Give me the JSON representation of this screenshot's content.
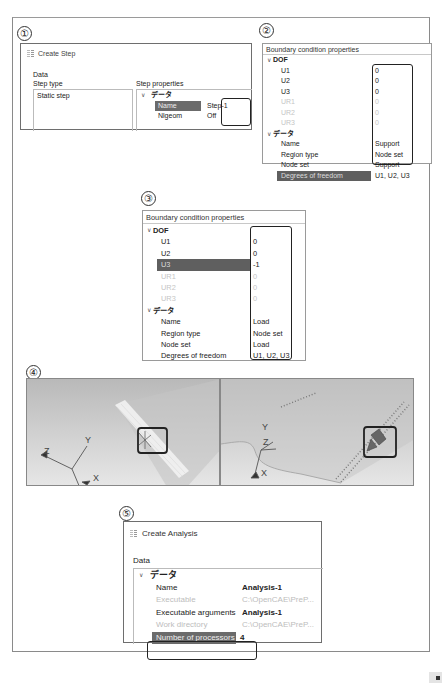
{
  "step_numbers": [
    "①",
    "②",
    "③",
    "④",
    "⑤"
  ],
  "panel1": {
    "dialog_title": "Create Step",
    "data_label": "Data",
    "step_type_label": "Step type",
    "step_properties_label": "Step properties",
    "step_types": [
      "Static step"
    ],
    "group_label": "データ",
    "properties": [
      {
        "key": "Name",
        "value": "Step-1",
        "selected": true
      },
      {
        "key": "Nlgeom",
        "value": "Off",
        "selected": false
      }
    ]
  },
  "panel2": {
    "header": "Boundary condition properties",
    "dof_group": "DOF",
    "dof": [
      {
        "key": "U1",
        "value": "0",
        "enabled": true
      },
      {
        "key": "U2",
        "value": "0",
        "enabled": true
      },
      {
        "key": "U3",
        "value": "0",
        "enabled": true
      },
      {
        "key": "UR1",
        "value": "0",
        "enabled": false
      },
      {
        "key": "UR2",
        "value": "0",
        "enabled": false
      },
      {
        "key": "UR3",
        "value": "0",
        "enabled": false
      }
    ],
    "data_group": "データ",
    "data": [
      {
        "key": "Name",
        "value": "Support"
      },
      {
        "key": "Region type",
        "value": "Node set"
      },
      {
        "key": "Node set",
        "value": "Support"
      },
      {
        "key": "Degrees of freedom",
        "value": "U1, U2, U3",
        "selected": true
      }
    ]
  },
  "panel3": {
    "header": "Boundary condition properties",
    "dof_group": "DOF",
    "dof": [
      {
        "key": "U1",
        "value": "0",
        "enabled": true
      },
      {
        "key": "U2",
        "value": "0",
        "enabled": true
      },
      {
        "key": "U3",
        "value": "-1",
        "enabled": true,
        "selected": true
      },
      {
        "key": "UR1",
        "value": "0",
        "enabled": false
      },
      {
        "key": "UR2",
        "value": "0",
        "enabled": false
      },
      {
        "key": "UR3",
        "value": "0",
        "enabled": false
      }
    ],
    "data_group": "データ",
    "data": [
      {
        "key": "Name",
        "value": "Load"
      },
      {
        "key": "Region type",
        "value": "Node set"
      },
      {
        "key": "Node set",
        "value": "Load"
      },
      {
        "key": "Degrees of freedom",
        "value": "U1, U2, U3"
      }
    ]
  },
  "panel4": {
    "left_view": {
      "axes": {
        "x": "X",
        "y": "Y",
        "z": "Z"
      }
    },
    "right_view": {
      "axes": {
        "x": "X",
        "y": "Y",
        "z": "Z"
      }
    }
  },
  "panel5": {
    "dialog_title": "Create Analysis",
    "data_label": "Data",
    "group_label": "データ",
    "properties": [
      {
        "key": "Name",
        "value": "Analysis-1",
        "style": "bold"
      },
      {
        "key": "Executable",
        "value": "C:\\OpenCAE\\PreP...",
        "style": "grey"
      },
      {
        "key": "Executable arguments",
        "value": "Analysis-1",
        "style": "bold"
      },
      {
        "key": "Work directory",
        "value": "C:\\OpenCAE\\PreP...",
        "style": "grey"
      },
      {
        "key": "Number of processors",
        "value": "4",
        "style": "selected"
      }
    ]
  },
  "colors": {
    "selection": "#6b6b6b",
    "highlight_box": "#222222",
    "viewport_top": "#b9b9b9",
    "viewport_bottom": "#e6e6e6",
    "disabled_text": "#c5c5c5"
  }
}
